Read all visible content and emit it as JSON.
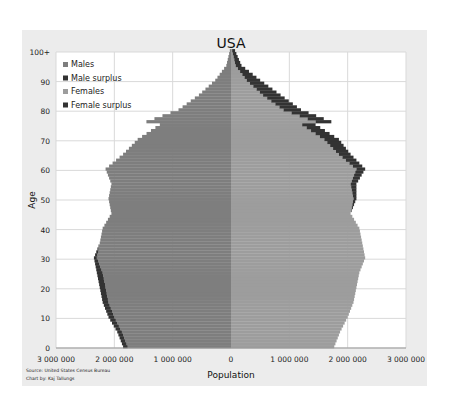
{
  "chart_data": {
    "type": "bar",
    "orientation": "horizontal-pyramid",
    "title": "USA",
    "subtitle": "1st of July 2022",
    "xlabel": "Population",
    "ylabel": "Age",
    "xlim": [
      -3000000,
      3000000
    ],
    "ylim": [
      0,
      100
    ],
    "grid": true,
    "legend_position": "top-left",
    "x_ticks": [
      {
        "value": -3000000,
        "label": "3 000 000"
      },
      {
        "value": -2000000,
        "label": "2 000 000"
      },
      {
        "value": -1000000,
        "label": "1 000 000"
      },
      {
        "value": 0,
        "label": "0"
      },
      {
        "value": 1000000,
        "label": "1 000 000"
      },
      {
        "value": 2000000,
        "label": "2 000 000"
      },
      {
        "value": 3000000,
        "label": "3 000 000"
      }
    ],
    "y_ticks": [
      {
        "value": 0,
        "label": "0"
      },
      {
        "value": 10,
        "label": "10"
      },
      {
        "value": 20,
        "label": "20"
      },
      {
        "value": 30,
        "label": "30"
      },
      {
        "value": 40,
        "label": "40"
      },
      {
        "value": 50,
        "label": "50"
      },
      {
        "value": 60,
        "label": "60"
      },
      {
        "value": 70,
        "label": "70"
      },
      {
        "value": 80,
        "label": "80"
      },
      {
        "value": 90,
        "label": "90"
      },
      {
        "value": 100,
        "label": "100+"
      }
    ],
    "legend": [
      {
        "name": "Males",
        "color": "#7e7e7e"
      },
      {
        "name": "Male surplus",
        "color": "#333333"
      },
      {
        "name": "Females",
        "color": "#9d9d9d"
      },
      {
        "name": "Female surplus",
        "color": "#333333"
      }
    ],
    "age_anchor_points": [
      0,
      5,
      10,
      15,
      20,
      25,
      30,
      35,
      40,
      45,
      50,
      55,
      60,
      65,
      70,
      75,
      76,
      80,
      85,
      90,
      95,
      100
    ],
    "males_millions": [
      1.85,
      1.95,
      2.1,
      2.2,
      2.25,
      2.3,
      2.35,
      2.25,
      2.2,
      2.05,
      2.1,
      2.05,
      2.15,
      1.85,
      1.6,
      1.22,
      1.45,
      0.9,
      0.55,
      0.27,
      0.08,
      0.02
    ],
    "females_millions": [
      1.77,
      1.87,
      2.0,
      2.1,
      2.15,
      2.2,
      2.3,
      2.25,
      2.2,
      2.05,
      2.15,
      2.15,
      2.3,
      2.05,
      1.85,
      1.45,
      1.72,
      1.2,
      0.85,
      0.5,
      0.18,
      0.07
    ],
    "source": "Source: United States Census Bureau",
    "author": "Chart by: Kaj Tallungs"
  }
}
